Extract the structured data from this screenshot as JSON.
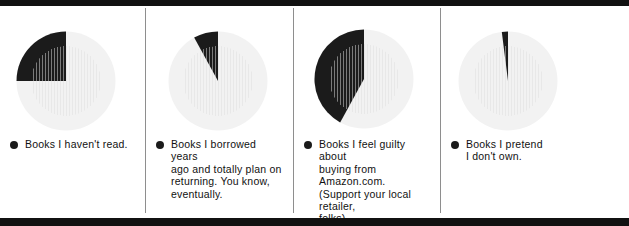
{
  "figure": {
    "type": "pie-chart-series",
    "panel_count": 4,
    "colors": {
      "slice_highlight": "#1b1b1b",
      "slice_remainder": "#f2f2f2",
      "rule": "#111111",
      "divider": "#8e8e8e",
      "text": "#111111"
    }
  },
  "panels": [
    {
      "id": "panel-1",
      "bullet_icon": "filled-circle-icon",
      "label": "Books I haven't read."
    },
    {
      "id": "panel-2",
      "bullet_icon": "filled-circle-icon",
      "label": "Books I borrowed years\nago and totally plan on\nreturning. You know,\neventually."
    },
    {
      "id": "panel-3",
      "bullet_icon": "filled-circle-icon",
      "label": "Books I feel guilty about\nbuying from Amazon.com.\n(Support your local retailer,\nfolks)."
    },
    {
      "id": "panel-4",
      "bullet_icon": "filled-circle-icon",
      "label": "Books I pretend\nI don't own."
    }
  ],
  "chart_data": [
    {
      "type": "pie",
      "title": "Books I haven't read.",
      "categories": [
        "Books I haven't read.",
        "Other"
      ],
      "values": [
        25,
        75
      ],
      "highlight_index": 0,
      "start_angle_deg": 0,
      "direction": "counterclockwise",
      "legend": "bottom"
    },
    {
      "type": "pie",
      "title": "Books I borrowed years ago and totally plan on returning. You know, eventually.",
      "categories": [
        "Books I borrowed years ago and totally plan on returning. You know, eventually.",
        "Other"
      ],
      "values": [
        8,
        92
      ],
      "highlight_index": 0,
      "start_angle_deg": 0,
      "direction": "counterclockwise",
      "legend": "bottom"
    },
    {
      "type": "pie",
      "title": "Books I feel guilty about buying from Amazon.com. (Support your local retailer, folks).",
      "categories": [
        "Books I feel guilty about buying from Amazon.com. (Support your local retailer, folks).",
        "Other"
      ],
      "values": [
        42,
        58
      ],
      "highlight_index": 0,
      "start_angle_deg": 0,
      "direction": "counterclockwise",
      "legend": "bottom"
    },
    {
      "type": "pie",
      "title": "Books I pretend I don't own.",
      "categories": [
        "Books I pretend I don't own.",
        "Other"
      ],
      "values": [
        2,
        98
      ],
      "highlight_index": 0,
      "start_angle_deg": 0,
      "direction": "counterclockwise",
      "legend": "bottom"
    }
  ]
}
